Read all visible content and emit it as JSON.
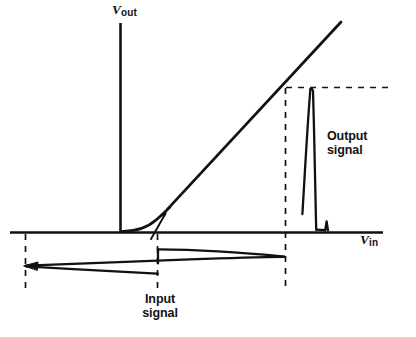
{
  "figure": {
    "background_color": "#ffffff",
    "ink_color": "#111111",
    "width": 416,
    "height": 337
  },
  "axes": {
    "vertical": {
      "name": "V",
      "subscript": "out",
      "label_text": "Vout",
      "x": 120,
      "y_top": 23,
      "y_bottom": 232
    },
    "horizontal": {
      "name": "V",
      "subscript": "in",
      "label_text": "Vin",
      "y": 232,
      "x_left": 10,
      "x_right": 383
    }
  },
  "transfer_curve": {
    "description": "nonlinear knee rising into a straight linear region",
    "knee_start": [
      122,
      231
    ],
    "knee_end": [
      168,
      209
    ],
    "line_end": [
      341,
      22
    ]
  },
  "annotations": {
    "knee_pointer": {
      "from": [
        152,
        238
      ],
      "to": [
        166,
        213
      ]
    }
  },
  "dashed_lines": {
    "left_vertical": {
      "x": 25,
      "y_top": 233,
      "y_bottom": 288
    },
    "mid_vertical": {
      "x": 157,
      "y_top": 233,
      "y_bottom": 288
    },
    "right_vertical": {
      "x": 285,
      "y_top": 88,
      "y_bottom": 288
    },
    "top_horizontal": {
      "y": 87,
      "x_left": 285,
      "x_right": 393
    }
  },
  "input_signal": {
    "label_line1": "Input",
    "label_line2": "signal",
    "left_tip": [
      25,
      266
    ],
    "right_tip": [
      285,
      257
    ],
    "step_x": 157,
    "upper_start_y": 249,
    "lower_end_y": 274
  },
  "output_signal": {
    "label_line1": "Output",
    "label_line2": "signal",
    "peak_apex": [
      311,
      88
    ],
    "peak_base_left": [
      302,
      214
    ],
    "peak_base_right": [
      316,
      230
    ],
    "notch_x": 327,
    "baseline_y": 232
  }
}
